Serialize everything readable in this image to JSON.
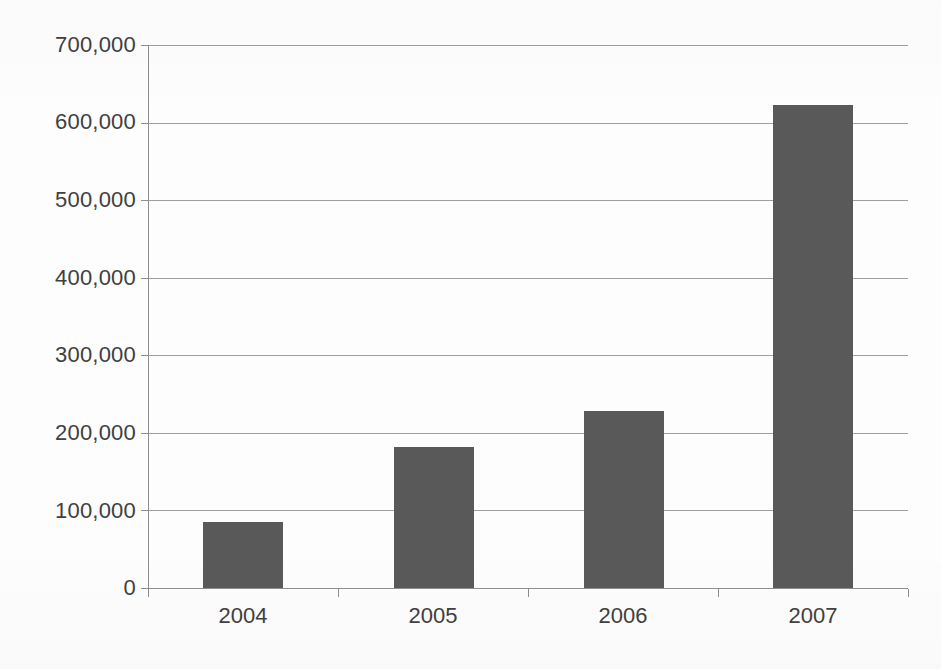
{
  "chart_data": {
    "type": "bar",
    "title": "",
    "subtitle": "",
    "xlabel": "",
    "ylabel": "",
    "categories": [
      "2004",
      "2005",
      "2006",
      "2007"
    ],
    "values": [
      85000,
      182000,
      228000,
      623000
    ],
    "series": [
      {
        "name": "",
        "values": [
          85000,
          182000,
          228000,
          623000
        ]
      }
    ],
    "ylim": [
      0,
      700000
    ],
    "y_ticks": [
      0,
      100000,
      200000,
      300000,
      400000,
      500000,
      600000,
      700000
    ],
    "y_tick_labels": [
      "0",
      "100,000",
      "200,000",
      "300,000",
      "400,000",
      "500,000",
      "600,000",
      "700,000"
    ],
    "grid": true,
    "grid_axis": "y",
    "legend": false,
    "legend_position": "none",
    "bar_color": "#595959",
    "grid_color": "#8d8d8d",
    "axis_color": "#8d8d8d",
    "text_color": "#404040",
    "background_color": "#fdfdfd",
    "annotations": []
  }
}
